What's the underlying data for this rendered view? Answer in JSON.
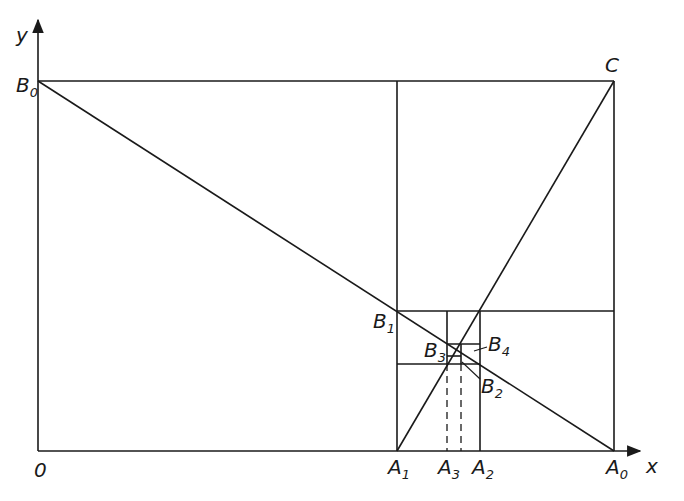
{
  "diagram": {
    "type": "cobweb-iteration",
    "axes": {
      "x_label": "x",
      "y_label": "y",
      "origin_label": "0"
    },
    "points": {
      "B0": {
        "main": "B",
        "sub": "0"
      },
      "B1": {
        "main": "B",
        "sub": "1"
      },
      "B2": {
        "main": "B",
        "sub": "2"
      },
      "B3": {
        "main": "B",
        "sub": "3"
      },
      "B4": {
        "main": "B",
        "sub": "4"
      },
      "C": {
        "main": "C",
        "sub": ""
      },
      "A0": {
        "main": "A",
        "sub": "0"
      },
      "A1": {
        "main": "A",
        "sub": "1"
      },
      "A2": {
        "main": "A",
        "sub": "2"
      },
      "A3": {
        "main": "A",
        "sub": "3"
      }
    },
    "colors": {
      "ink": "#1a1a1a",
      "background": "#ffffff"
    }
  }
}
